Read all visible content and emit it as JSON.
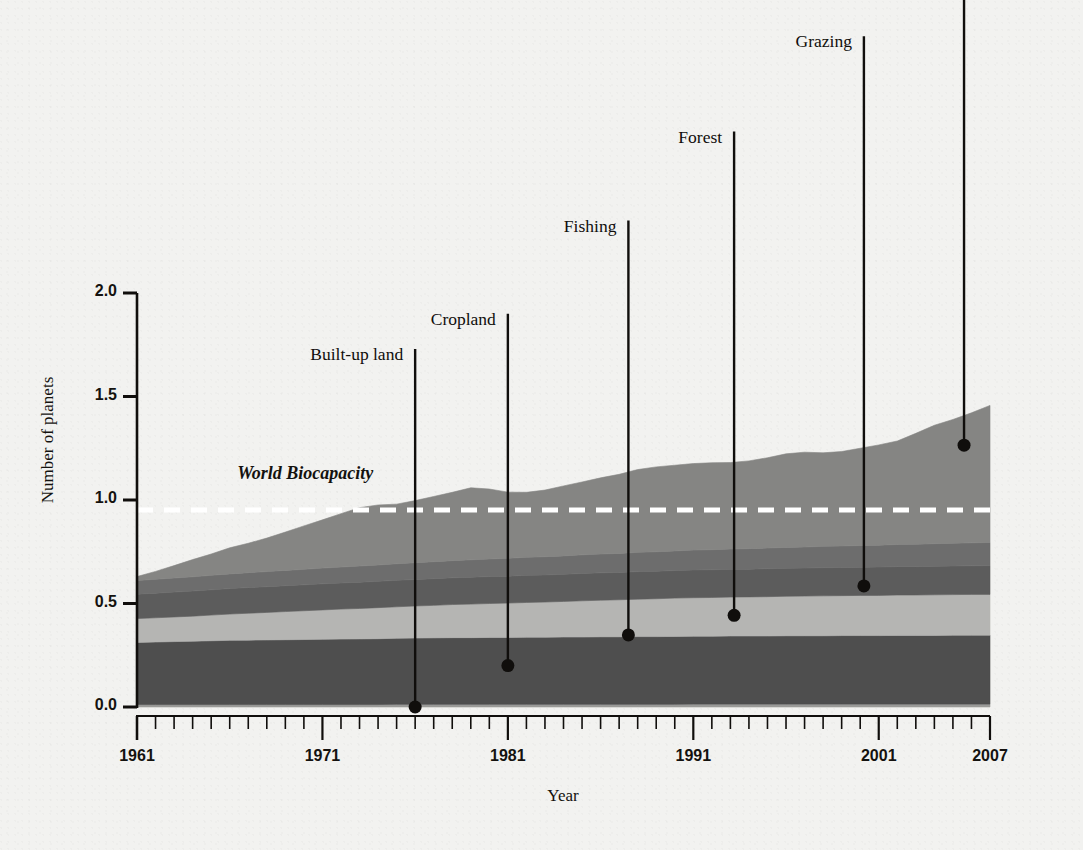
{
  "chart_data": {
    "type": "area",
    "title": "",
    "subtitle": "",
    "xlabel": "Year",
    "ylabel": "Number of planets",
    "xlim": [
      1961,
      2007
    ],
    "ylim": [
      0.0,
      2.0
    ],
    "grid": false,
    "legend_position": "inline-callouts",
    "stacked": true,
    "x_tick_labels": [
      "1961",
      "1971",
      "1981",
      "1991",
      "2001",
      "2007"
    ],
    "x_tick_values": [
      1961,
      1971,
      1981,
      1991,
      2001,
      2007
    ],
    "x_minor_tick_interval": 1,
    "y_tick_labels": [
      "0.0",
      "0.5",
      "1.0",
      "1.5",
      "2.0"
    ],
    "y_tick_values": [
      0.0,
      0.5,
      1.0,
      1.5,
      2.0
    ],
    "x": [
      1961,
      1962,
      1963,
      1964,
      1965,
      1966,
      1967,
      1968,
      1969,
      1970,
      1971,
      1972,
      1973,
      1974,
      1975,
      1976,
      1977,
      1978,
      1979,
      1980,
      1981,
      1982,
      1983,
      1984,
      1985,
      1986,
      1987,
      1988,
      1989,
      1990,
      1991,
      1992,
      1993,
      1994,
      1995,
      1996,
      1997,
      1998,
      1999,
      2000,
      2001,
      2002,
      2003,
      2004,
      2005,
      2006,
      2007
    ],
    "series": [
      {
        "name": "Built-up land",
        "color": "#9a9a98",
        "values": [
          0.012,
          0.012,
          0.012,
          0.012,
          0.012,
          0.012,
          0.012,
          0.012,
          0.012,
          0.012,
          0.012,
          0.012,
          0.012,
          0.012,
          0.013,
          0.013,
          0.013,
          0.013,
          0.013,
          0.013,
          0.013,
          0.013,
          0.013,
          0.013,
          0.013,
          0.013,
          0.013,
          0.013,
          0.013,
          0.013,
          0.014,
          0.014,
          0.014,
          0.014,
          0.014,
          0.014,
          0.014,
          0.014,
          0.014,
          0.014,
          0.014,
          0.014,
          0.014,
          0.014,
          0.014,
          0.014,
          0.014
        ]
      },
      {
        "name": "Cropland",
        "color": "#4e4e4e",
        "values": [
          0.3,
          0.302,
          0.304,
          0.306,
          0.308,
          0.31,
          0.311,
          0.312,
          0.313,
          0.314,
          0.315,
          0.316,
          0.317,
          0.318,
          0.319,
          0.32,
          0.321,
          0.322,
          0.322,
          0.323,
          0.323,
          0.324,
          0.324,
          0.325,
          0.325,
          0.326,
          0.326,
          0.327,
          0.327,
          0.328,
          0.328,
          0.328,
          0.329,
          0.329,
          0.329,
          0.33,
          0.33,
          0.33,
          0.331,
          0.331,
          0.331,
          0.332,
          0.332,
          0.332,
          0.333,
          0.333,
          0.333
        ]
      },
      {
        "name": "Fishing",
        "color": "#b5b5b3",
        "values": [
          0.115,
          0.117,
          0.119,
          0.121,
          0.124,
          0.127,
          0.13,
          0.133,
          0.136,
          0.139,
          0.142,
          0.145,
          0.147,
          0.15,
          0.152,
          0.155,
          0.157,
          0.16,
          0.162,
          0.164,
          0.166,
          0.168,
          0.17,
          0.172,
          0.175,
          0.177,
          0.179,
          0.181,
          0.183,
          0.185,
          0.186,
          0.187,
          0.188,
          0.189,
          0.19,
          0.191,
          0.192,
          0.193,
          0.193,
          0.194,
          0.194,
          0.195,
          0.195,
          0.196,
          0.196,
          0.197,
          0.197
        ]
      },
      {
        "name": "Forest",
        "color": "#5c5c5c",
        "values": [
          0.118,
          0.119,
          0.12,
          0.121,
          0.122,
          0.123,
          0.124,
          0.124,
          0.125,
          0.125,
          0.126,
          0.126,
          0.127,
          0.127,
          0.128,
          0.128,
          0.129,
          0.129,
          0.13,
          0.13,
          0.13,
          0.131,
          0.131,
          0.131,
          0.132,
          0.132,
          0.132,
          0.133,
          0.133,
          0.133,
          0.134,
          0.134,
          0.134,
          0.134,
          0.135,
          0.135,
          0.135,
          0.136,
          0.136,
          0.136,
          0.137,
          0.137,
          0.137,
          0.138,
          0.138,
          0.138,
          0.139
        ]
      },
      {
        "name": "Grazing",
        "color": "#6d6d6d",
        "values": [
          0.066,
          0.067,
          0.068,
          0.069,
          0.07,
          0.071,
          0.072,
          0.073,
          0.074,
          0.075,
          0.076,
          0.077,
          0.078,
          0.079,
          0.08,
          0.081,
          0.082,
          0.083,
          0.084,
          0.085,
          0.086,
          0.087,
          0.088,
          0.089,
          0.09,
          0.091,
          0.092,
          0.093,
          0.094,
          0.095,
          0.096,
          0.097,
          0.098,
          0.099,
          0.1,
          0.101,
          0.102,
          0.103,
          0.104,
          0.105,
          0.106,
          0.107,
          0.108,
          0.109,
          0.11,
          0.111,
          0.112
        ]
      },
      {
        "name": "Carbon",
        "color": "#858583",
        "values": [
          0.019,
          0.038,
          0.06,
          0.083,
          0.103,
          0.126,
          0.142,
          0.162,
          0.185,
          0.21,
          0.233,
          0.258,
          0.282,
          0.29,
          0.288,
          0.3,
          0.315,
          0.33,
          0.348,
          0.338,
          0.32,
          0.314,
          0.322,
          0.338,
          0.352,
          0.368,
          0.382,
          0.4,
          0.41,
          0.414,
          0.418,
          0.42,
          0.418,
          0.424,
          0.436,
          0.452,
          0.458,
          0.452,
          0.456,
          0.47,
          0.484,
          0.5,
          0.536,
          0.572,
          0.598,
          0.628,
          0.662
        ]
      }
    ],
    "reference_line": {
      "label": "World Biocapacity",
      "value": 0.952,
      "style": "dashed",
      "color": "#ffffff",
      "label_x": 1966.4,
      "label_y": 1.12
    },
    "callouts": [
      {
        "label": "Built-up land",
        "x": 1976.0,
        "y": 0.0,
        "label_y": 1.73
      },
      {
        "label": "Cropland",
        "x": 1981.0,
        "y": 0.2,
        "label_y": 1.9
      },
      {
        "label": "Fishing",
        "x": 1987.5,
        "y": 0.348,
        "label_y": 2.35
      },
      {
        "label": "Forest",
        "x": 1993.2,
        "y": 0.443,
        "label_y": 2.78
      },
      {
        "label": "Grazing",
        "x": 2000.2,
        "y": 0.585,
        "label_y": 3.24
      },
      {
        "label": "Carbon",
        "x": 2005.6,
        "y": 1.265,
        "label_y": 3.62
      }
    ]
  },
  "axes": {
    "y_title": "Number of planets",
    "x_title": "Year"
  },
  "colors": {
    "background": "#f2f2f0",
    "axis": "#100e0c",
    "text": "#14120f",
    "callout_line": "#100e0c",
    "biocapacity_line": "#ffffff"
  }
}
